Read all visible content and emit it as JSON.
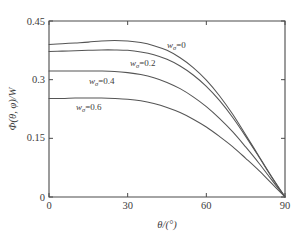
{
  "chart_data": {
    "type": "line",
    "title": "",
    "subtitle": "",
    "xlabel": "θ/(°)",
    "ylabel": "Φ(θ, φ)/W",
    "xlim": [
      0,
      90
    ],
    "ylim": [
      0,
      0.45
    ],
    "xticks": [
      0,
      30,
      60,
      90
    ],
    "xtick_labels": [
      "0",
      "30",
      "60",
      "90"
    ],
    "yticks": [
      0,
      0.15,
      0.3,
      0.45
    ],
    "ytick_labels": [
      "0",
      "0.15",
      "0.3",
      "0.45"
    ],
    "grid": false,
    "legend": "inline-annotations",
    "legend_position": "inside-plot",
    "x": [
      0,
      5,
      10,
      15,
      20,
      25,
      30,
      35,
      40,
      45,
      50,
      55,
      60,
      65,
      70,
      75,
      80,
      85,
      90
    ],
    "series": [
      {
        "name": "wσ = 0",
        "label": "w",
        "label_sub": "σ",
        "label_value": "=0",
        "color": "#555555",
        "values": [
          0.39,
          0.392,
          0.394,
          0.396,
          0.399,
          0.4,
          0.399,
          0.395,
          0.387,
          0.375,
          0.356,
          0.331,
          0.299,
          0.259,
          0.212,
          0.159,
          0.105,
          0.051,
          0.0
        ]
      },
      {
        "name": "wσ = 0.2",
        "label": "w",
        "label_sub": "σ",
        "label_value": "=0.2",
        "color": "#555555",
        "values": [
          0.372,
          0.373,
          0.374,
          0.375,
          0.376,
          0.376,
          0.375,
          0.371,
          0.364,
          0.352,
          0.335,
          0.312,
          0.283,
          0.247,
          0.204,
          0.155,
          0.103,
          0.05,
          0.0
        ]
      },
      {
        "name": "wσ = 0.4",
        "label": "w",
        "label_sub": "σ",
        "label_value": "=0.4",
        "color": "#555555",
        "values": [
          0.322,
          0.322,
          0.322,
          0.322,
          0.322,
          0.321,
          0.318,
          0.313,
          0.305,
          0.293,
          0.277,
          0.256,
          0.231,
          0.201,
          0.167,
          0.128,
          0.087,
          0.043,
          0.0
        ]
      },
      {
        "name": "wσ = 0.6",
        "label": "w",
        "label_sub": "σ",
        "label_value": "=0.6",
        "color": "#555555",
        "values": [
          0.252,
          0.252,
          0.253,
          0.253,
          0.253,
          0.252,
          0.25,
          0.246,
          0.239,
          0.229,
          0.216,
          0.199,
          0.179,
          0.155,
          0.129,
          0.099,
          0.068,
          0.034,
          0.0
        ]
      }
    ],
    "annotations": [
      {
        "text": "wσ =0",
        "x": 45,
        "y": 0.372
      },
      {
        "text": "wσ =0.2",
        "x": 32.5,
        "y": 0.33
      },
      {
        "text": "wσ =0.4",
        "x": 17,
        "y": 0.295
      },
      {
        "text": "wσ =0.6",
        "x": 12,
        "y": 0.228
      }
    ]
  },
  "axes": {
    "x_title": "θ/(°)",
    "y_title_head": "Φ",
    "y_title_paren_open": "(",
    "y_title_theta": "θ",
    "y_title_comma": ", ",
    "y_title_phi": "φ",
    "y_title_paren_close": ")",
    "y_title_over_w": "/W",
    "xtick_0": "0",
    "xtick_30": "30",
    "xtick_60": "60",
    "xtick_90": "90",
    "ytick_0": "0",
    "ytick_15": "0.15",
    "ytick_30": "0.3",
    "ytick_45": "0.45"
  },
  "labels": {
    "w_glyph": "w",
    "sigma_glyph": "σ",
    "curve0_value": "=0",
    "curve1_value": "=0.2",
    "curve2_value": "=0.4",
    "curve3_value": "=0.6"
  },
  "colors": {
    "curve": "#555555",
    "axis": "#4a4a4a",
    "text": "#3d3d3d",
    "background": "#ffffff"
  }
}
